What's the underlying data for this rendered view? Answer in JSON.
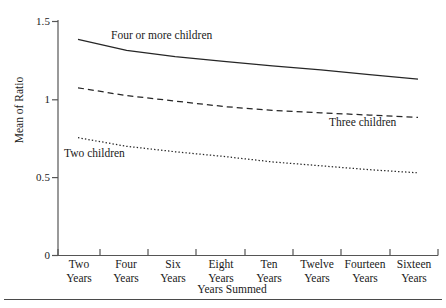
{
  "chart_data": {
    "type": "line",
    "title": "",
    "xlabel": "Years Summed",
    "ylabel": "Mean of Ratio",
    "ylim": [
      0,
      1.5
    ],
    "yticks": [
      0,
      0.5,
      1,
      1.5
    ],
    "ytick_labels": [
      "0",
      "0.5",
      "1",
      "1.5"
    ],
    "grid": false,
    "legend_position": "inline-annotations",
    "categories": [
      "Two Years",
      "Four Years",
      "Six Years",
      "Eight Years",
      "Ten Years",
      "Twelve Years",
      "Fourteen Years",
      "Sixteen Years"
    ],
    "category_lines": [
      [
        "Two",
        "Years"
      ],
      [
        "Four",
        "Years"
      ],
      [
        "Six",
        "Years"
      ],
      [
        "Eight",
        "Years"
      ],
      [
        "Ten",
        "Years"
      ],
      [
        "Twelve",
        "Years"
      ],
      [
        "Fourteen",
        "Years"
      ],
      [
        "Sixteen",
        "Years"
      ]
    ],
    "series": [
      {
        "name": "Four or more children",
        "style": "solid",
        "values": [
          1.385,
          1.315,
          1.275,
          1.245,
          1.215,
          1.19,
          1.16,
          1.13
        ]
      },
      {
        "name": "Three children",
        "style": "dashed",
        "values": [
          1.075,
          1.025,
          0.99,
          0.955,
          0.93,
          0.915,
          0.9,
          0.885
        ]
      },
      {
        "name": "Two children",
        "style": "dotted",
        "values": [
          0.755,
          0.7,
          0.665,
          0.635,
          0.6,
          0.575,
          0.55,
          0.53
        ]
      }
    ],
    "annotations": [
      {
        "text": "Four or more children",
        "series": "Four or more children"
      },
      {
        "text": "Three children",
        "series": "Three children"
      },
      {
        "text": "Two children",
        "series": "Two children"
      }
    ],
    "colors": {
      "line": "#262626",
      "axis": "#555555",
      "text": "#1a1a1a",
      "rule": "#4a4a4a",
      "background": "#ffffff"
    }
  }
}
